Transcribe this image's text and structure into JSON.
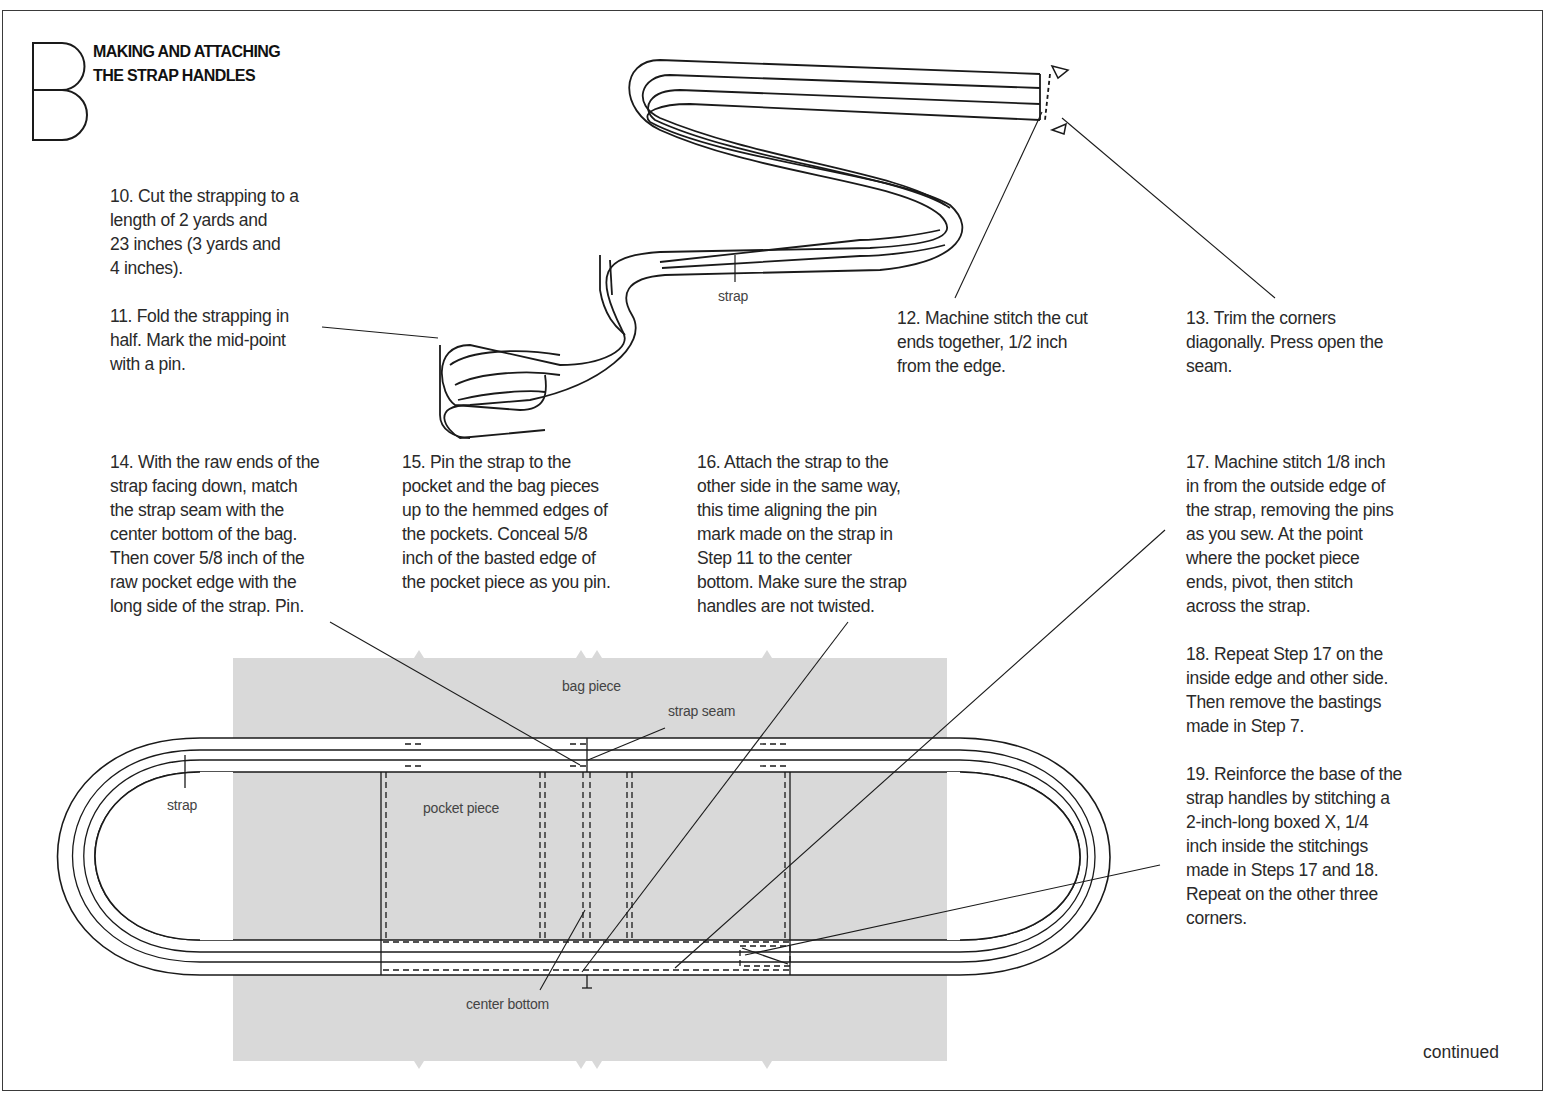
{
  "section": {
    "letter": "B",
    "title_line1": "MAKING AND ATTACHING",
    "title_line2": "THE STRAP HANDLES"
  },
  "steps": [
    {
      "num": 10,
      "text": "10. Cut the strapping to a\nlength of 2 yards and\n23 inches (3 yards and\n4 inches)."
    },
    {
      "num": 11,
      "text": "11. Fold the strapping in\nhalf. Mark the mid-point\nwith a pin."
    },
    {
      "num": 12,
      "text": "12. Machine stitch the cut\nends together, 1/2 inch\nfrom the edge."
    },
    {
      "num": 13,
      "text": "13. Trim the corners\ndiagonally. Press open the\nseam."
    },
    {
      "num": 14,
      "text": "14. With the raw ends of the\nstrap facing down, match\nthe strap seam with the\ncenter bottom of the bag.\nThen cover 5/8 inch of the\nraw pocket edge with the\nlong side of the strap. Pin."
    },
    {
      "num": 15,
      "text": "15. Pin the strap to the\npocket and the bag pieces\nup to the hemmed edges of\nthe pockets. Conceal 5/8\ninch of the basted edge of\nthe pocket piece as you pin."
    },
    {
      "num": 16,
      "text": "16. Attach the strap to the\nother side in the same way,\nthis time aligning the pin\nmark made on the strap in\nStep 11 to the center\nbottom. Make sure the strap\nhandles are not twisted."
    },
    {
      "num": 17,
      "text": "17. Machine stitch 1/8 inch\nin from the outside edge of\nthe strap, removing the pins\nas you sew. At the point\nwhere the pocket piece\nends, pivot, then stitch\nacross the strap."
    },
    {
      "num": 18,
      "text": "18. Repeat Step 17 on the\ninside edge and other side.\nThen remove the bastings\nmade in Step 7."
    },
    {
      "num": 19,
      "text": "19. Reinforce the base of the\nstrap handles by stitching a\n2-inch-long boxed X, 1/4\ninch inside the stitchings\nmade in Steps 17 and 18.\nRepeat on the other three\ncorners."
    }
  ],
  "labels": {
    "strap_top": "strap",
    "bag_piece": "bag piece",
    "strap_seam": "strap seam",
    "strap_bottom": "strap",
    "pocket_piece": "pocket piece",
    "center_bottom": "center bottom"
  },
  "footer": {
    "continued": "continued"
  },
  "colors": {
    "bag_fill": "#d9d9d9",
    "line": "#1a1a1a",
    "border": "#3a3a3a"
  }
}
